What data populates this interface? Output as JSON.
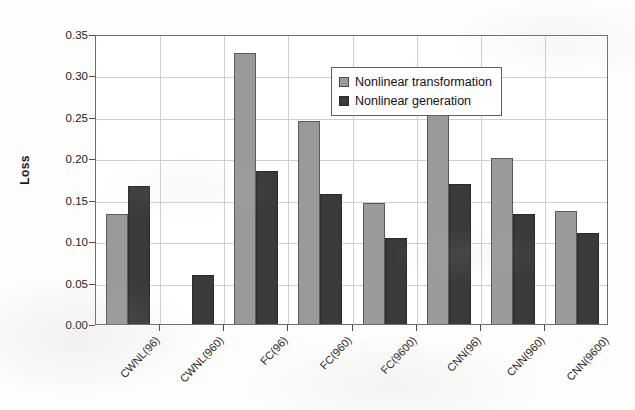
{
  "chart_data": {
    "type": "bar",
    "title": "",
    "xlabel": "",
    "ylabel": "Loss",
    "ylim": [
      0.0,
      0.35
    ],
    "ytick_labels": [
      "0.35",
      "0.30",
      "0.25",
      "0.20",
      "0.15",
      "0.10",
      "0.05",
      "0.00"
    ],
    "ytick_values": [
      0.35,
      0.3,
      0.25,
      0.2,
      0.15,
      0.1,
      0.05,
      0.0
    ],
    "grid": "horizontal-and-vertical",
    "legend_position": "inside-upper-center-left",
    "categories": [
      "CWNL(96)",
      "CWNL(960)",
      "FC(96)",
      "FC(960)",
      "FC(9600)",
      "CNN(96)",
      "CNN(960)",
      "CNN(9600)"
    ],
    "series": [
      {
        "name": "Nonlinear transformation",
        "color": "#9a9a9a",
        "values": [
          0.133,
          null,
          0.327,
          0.245,
          0.146,
          0.306,
          0.2,
          0.136
        ]
      },
      {
        "name": "Nonlinear generation",
        "color": "#3a3a3a",
        "values": [
          0.166,
          0.059,
          0.185,
          0.157,
          0.104,
          0.169,
          0.133,
          0.11
        ]
      }
    ]
  }
}
